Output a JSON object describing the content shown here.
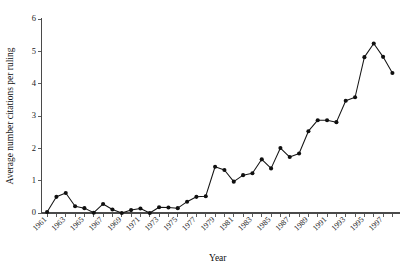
{
  "chart_data": {
    "type": "line",
    "title": "",
    "subtitle": "",
    "xlabel": "Year",
    "ylabel": "Average number citations per ruling",
    "xlim": [
      1960.4,
      1998.6
    ],
    "ylim": [
      0,
      6
    ],
    "yticks": [
      0,
      1,
      2,
      3,
      4,
      5,
      6
    ],
    "ytick_labels": [
      "0",
      "1",
      "2",
      "3",
      "4",
      "5",
      "6"
    ],
    "xticks": [
      1961,
      1962,
      1963,
      1964,
      1965,
      1966,
      1967,
      1968,
      1969,
      1970,
      1971,
      1972,
      1973,
      1974,
      1975,
      1976,
      1977,
      1978,
      1979,
      1980,
      1981,
      1982,
      1983,
      1984,
      1985,
      1986,
      1987,
      1988,
      1989,
      1990,
      1991,
      1992,
      1993,
      1994,
      1995,
      1996,
      1997,
      1998
    ],
    "xtick_labels": [
      "1961",
      "",
      "1963",
      "",
      "1965",
      "",
      "1967",
      "",
      "1969",
      "",
      "1971",
      "",
      "1973",
      "",
      "1975",
      "",
      "1977",
      "",
      "1979",
      "",
      "1981",
      "",
      "1983",
      "",
      "1985",
      "",
      "1987",
      "",
      "1989",
      "",
      "1991",
      "",
      "1993",
      "",
      "1995",
      "",
      "1997",
      ""
    ],
    "xtick_labels_shown": [
      "1961",
      "1963",
      "1965",
      "1967",
      "1969",
      "1971",
      "1973",
      "1975",
      "1977",
      "1979",
      "1981",
      "1983",
      "1985",
      "1987",
      "1989",
      "1991",
      "1993",
      "1995",
      "1997"
    ],
    "grid": false,
    "legend": false,
    "legend_position": "none",
    "marker": "filled-circle",
    "line_color": "#141414",
    "marker_color": "#101010",
    "x": [
      1961,
      1962,
      1963,
      1964,
      1965,
      1966,
      1967,
      1968,
      1969,
      1970,
      1971,
      1972,
      1973,
      1974,
      1975,
      1976,
      1977,
      1978,
      1979,
      1980,
      1981,
      1982,
      1983,
      1984,
      1985,
      1986,
      1987,
      1988,
      1989,
      1990,
      1991,
      1992,
      1993,
      1994,
      1995,
      1996,
      1997,
      1998
    ],
    "values": [
      0.03,
      0.5,
      0.62,
      0.21,
      0.15,
      0.01,
      0.28,
      0.11,
      0.0,
      0.09,
      0.14,
      0.0,
      0.18,
      0.17,
      0.15,
      0.35,
      0.5,
      0.52,
      1.43,
      1.33,
      0.97,
      1.17,
      1.23,
      1.66,
      1.38,
      2.01,
      1.73,
      1.84,
      2.53,
      2.87,
      2.87,
      2.81,
      3.47,
      3.58,
      4.82,
      5.24,
      4.83,
      4.33
    ],
    "series": [
      {
        "name": "Average number citations per ruling",
        "values": [
          0.03,
          0.5,
          0.62,
          0.21,
          0.15,
          0.01,
          0.28,
          0.11,
          0.0,
          0.09,
          0.14,
          0.0,
          0.18,
          0.17,
          0.15,
          0.35,
          0.5,
          0.52,
          1.43,
          1.33,
          0.97,
          1.17,
          1.23,
          1.66,
          1.38,
          2.01,
          1.73,
          1.84,
          2.53,
          2.87,
          2.87,
          2.81,
          3.47,
          3.58,
          4.82,
          5.24,
          4.83,
          4.33
        ]
      }
    ],
    "annotations": [],
    "peak": {
      "x": 1996,
      "y": 5.24
    }
  }
}
